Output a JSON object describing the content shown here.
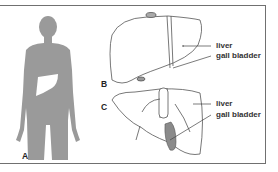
{
  "figure": {
    "panels": [
      {
        "id": "A",
        "label": "A",
        "description": "human body silhouette with liver highlighted"
      },
      {
        "id": "B",
        "label": "B",
        "description": "liver anterior view"
      },
      {
        "id": "C",
        "label": "C",
        "description": "liver inferior view with gall bladder"
      }
    ],
    "annotations": {
      "B": {
        "liver": "liver",
        "gall_bladder": "gall bladder"
      },
      "C": {
        "liver": "liver",
        "gall_bladder": "gall bladder"
      }
    },
    "colors": {
      "silhouette": "#9a9a9a",
      "liver_highlight": "#ffffff",
      "outline": "#555555",
      "gall_bladder_fill": "#8a8a8a",
      "frame": "#707070"
    }
  }
}
